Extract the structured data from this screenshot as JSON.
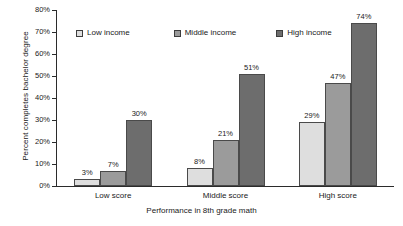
{
  "chart_data": {
    "type": "bar",
    "title": "",
    "subtitle": "",
    "xlabel": "Performance in 8th grade math",
    "ylabel": "Percent completes bachelor degree",
    "categories": [
      "Low score",
      "Middle score",
      "High score"
    ],
    "series": [
      {
        "name": "Low income",
        "values": [
          3,
          7,
          29
        ],
        "color": "#dedede"
      },
      {
        "name": "Middle income",
        "values": [
          7,
          21,
          47
        ],
        "color": "#9b9b9b"
      },
      {
        "name": "High income",
        "values": [
          30,
          51,
          74
        ],
        "color": "#6d6d6d"
      }
    ],
    "value_labels": [
      [
        "3%",
        "7%",
        "30%"
      ],
      [
        "8%",
        "21%",
        "51%"
      ],
      [
        "29%",
        "47%",
        "74%"
      ]
    ],
    "bar_values_by_group": [
      [
        3,
        7,
        30
      ],
      [
        8,
        21,
        51
      ],
      [
        29,
        47,
        74
      ]
    ],
    "ylim": [
      0,
      80
    ],
    "y_ticks": [
      0,
      10,
      20,
      30,
      40,
      50,
      60,
      70,
      80
    ],
    "y_tick_labels": [
      "0%",
      "10%",
      "20%",
      "30%",
      "40%",
      "50%",
      "60%",
      "70%",
      "80%"
    ],
    "grid": false,
    "legend_position": "top-inside",
    "legend": [
      "Low income",
      "Middle income",
      "High income"
    ]
  },
  "colors": {
    "low_income": "#dedede",
    "middle_income": "#9b9b9b",
    "high_income": "#6d6d6d",
    "axis": "#2b2b2b",
    "bar_border": "#4a4a4a",
    "text": "#1a1a1a",
    "background": "#ffffff"
  }
}
